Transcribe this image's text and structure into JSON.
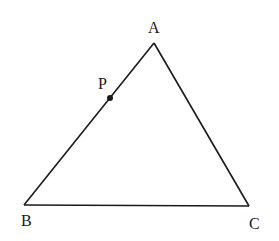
{
  "diagram": {
    "type": "geometry-triangle",
    "stroke_color": "#1a1a1a",
    "background": "#ffffff",
    "vertices": {
      "A": {
        "label": "A",
        "x": 154,
        "y": 43
      },
      "B": {
        "label": "B",
        "x": 24,
        "y": 205
      },
      "C": {
        "label": "C",
        "x": 249,
        "y": 206
      }
    },
    "point_P": {
      "label": "P",
      "x": 110,
      "y": 98,
      "on_segment": "AB"
    },
    "segments": [
      "AB",
      "BC",
      "CA"
    ]
  }
}
